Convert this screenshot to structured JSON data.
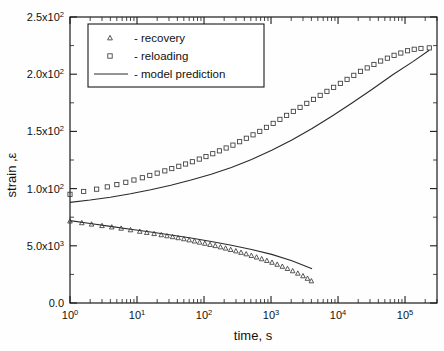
{
  "chart_data": {
    "type": "scatter",
    "title": "",
    "xlabel": "time, s",
    "ylabel": "strain ,ε",
    "xscale": "log",
    "yscale": "linear",
    "xlim": [
      1,
      300000
    ],
    "ylim": [
      0,
      250
    ],
    "grid": false,
    "legend_position": "top-left",
    "xticklabels": [
      "10",
      "10",
      "10",
      "10",
      "10",
      "10"
    ],
    "xtickexponents": [
      "0",
      "1",
      "2",
      "3",
      "4",
      "5"
    ],
    "xtickvalues": [
      1,
      10,
      100,
      1000,
      10000,
      100000
    ],
    "yticklabels": [
      "0.0",
      "5.0x10",
      "1.0x10",
      "1.5x10",
      "2.0x10",
      "2.5x10"
    ],
    "ytickexponents": [
      "",
      "3",
      "2",
      "2",
      "2",
      "2"
    ],
    "ytickvalues": [
      0,
      50,
      100,
      150,
      200,
      250
    ],
    "series": [
      {
        "name": "recovery",
        "marker": "triangle",
        "legend_label": "- recovery",
        "points": [
          [
            1.0,
            71.5
          ],
          [
            1.5,
            70.0
          ],
          [
            2.1,
            68.8
          ],
          [
            3.0,
            67.5
          ],
          [
            4.2,
            66.3
          ],
          [
            5.8,
            65.2
          ],
          [
            8.0,
            63.8
          ],
          [
            11.0,
            62.5
          ],
          [
            14.0,
            61.5
          ],
          [
            18.0,
            60.5
          ],
          [
            23.0,
            59.5
          ],
          [
            28.0,
            58.6
          ],
          [
            34.0,
            57.8
          ],
          [
            41.0,
            56.9
          ],
          [
            50.0,
            56.0
          ],
          [
            60.0,
            55.0
          ],
          [
            72.0,
            54.0
          ],
          [
            86.0,
            53.0
          ],
          [
            103.0,
            52.0
          ],
          [
            123.0,
            51.0
          ],
          [
            147.0,
            50.0
          ],
          [
            176.0,
            48.9
          ],
          [
            210.0,
            47.8
          ],
          [
            250.0,
            46.6
          ],
          [
            299.0,
            45.4
          ],
          [
            357.0,
            44.1
          ],
          [
            426.0,
            42.8
          ],
          [
            509.0,
            41.4
          ],
          [
            608.0,
            40.0
          ],
          [
            726.0,
            38.5
          ],
          [
            867.0,
            37.0
          ],
          [
            1035.0,
            35.4
          ],
          [
            1236.0,
            33.7
          ],
          [
            1476.0,
            31.9
          ],
          [
            1762.0,
            30.0
          ],
          [
            2104.0,
            28.0
          ],
          [
            2512.0,
            25.9
          ],
          [
            3000.0,
            23.6
          ],
          [
            3500.0,
            21.4
          ],
          [
            4000.0,
            19.2
          ]
        ]
      },
      {
        "name": "reloading",
        "marker": "square",
        "legend_label": "- reloading",
        "points": [
          [
            1.0,
            95.0
          ],
          [
            1.6,
            97.5
          ],
          [
            2.5,
            99.5
          ],
          [
            3.6,
            101.5
          ],
          [
            5.0,
            103.5
          ],
          [
            6.8,
            105.5
          ],
          [
            9.0,
            107.5
          ],
          [
            12.0,
            109.5
          ],
          [
            15.5,
            111.5
          ],
          [
            20.0,
            113.5
          ],
          [
            26.0,
            115.5
          ],
          [
            33.0,
            117.5
          ],
          [
            42.0,
            119.5
          ],
          [
            53.0,
            121.5
          ],
          [
            67.0,
            123.5
          ],
          [
            85.0,
            125.8
          ],
          [
            107.0,
            128.0
          ],
          [
            135.0,
            130.5
          ],
          [
            170.0,
            133.0
          ],
          [
            214.0,
            135.5
          ],
          [
            270.0,
            138.0
          ],
          [
            340.0,
            141.0
          ],
          [
            428.0,
            144.0
          ],
          [
            539.0,
            147.0
          ],
          [
            679.0,
            150.0
          ],
          [
            855.0,
            153.5
          ],
          [
            1077.0,
            157.0
          ],
          [
            1357.0,
            160.5
          ],
          [
            1709.0,
            164.0
          ],
          [
            2153.0,
            167.5
          ],
          [
            2712.0,
            171.0
          ],
          [
            3416.0,
            174.5
          ],
          [
            4303.0,
            178.0
          ],
          [
            5420.0,
            181.5
          ],
          [
            6827.0,
            185.0
          ],
          [
            8600.0,
            188.5
          ],
          [
            10832.0,
            192.0
          ],
          [
            13644.0,
            195.5
          ],
          [
            17185.0,
            199.0
          ],
          [
            21646.0,
            202.5
          ],
          [
            27265.0,
            205.5
          ],
          [
            34344.0,
            208.5
          ],
          [
            43260.0,
            211.5
          ],
          [
            54491.0,
            214.0
          ],
          [
            68640.0,
            216.5
          ],
          [
            86463.0,
            218.5
          ],
          [
            108914.0,
            220.5
          ],
          [
            137187.0,
            221.8
          ],
          [
            172800.0,
            222.5
          ],
          [
            230000.0,
            223.0
          ]
        ]
      },
      {
        "name": "model prediction",
        "marker": "line",
        "legend_label": "- model prediction",
        "curves": [
          {
            "id": "model-upper",
            "points": [
              [
                1.0,
                88.0
              ],
              [
                2.0,
                90.0
              ],
              [
                4.0,
                92.5
              ],
              [
                8.0,
                95.5
              ],
              [
                16.0,
                99.0
              ],
              [
                32.0,
                103.0
              ],
              [
                64.0,
                107.5
              ],
              [
                128.0,
                112.5
              ],
              [
                256.0,
                118.5
              ],
              [
                512.0,
                125.5
              ],
              [
                1024.0,
                133.5
              ],
              [
                2048.0,
                142.5
              ],
              [
                4096.0,
                152.5
              ],
              [
                8192.0,
                163.5
              ],
              [
                16384.0,
                175.0
              ],
              [
                32768.0,
                187.0
              ],
              [
                65536.0,
                199.5
              ],
              [
                131072.0,
                211.0
              ],
              [
                230000.0,
                221.0
              ]
            ]
          },
          {
            "id": "model-lower",
            "points": [
              [
                1.0,
                72.0
              ],
              [
                2.0,
                69.5
              ],
              [
                4.0,
                67.0
              ],
              [
                8.0,
                64.5
              ],
              [
                16.0,
                62.0
              ],
              [
                32.0,
                59.5
              ],
              [
                64.0,
                56.8
              ],
              [
                128.0,
                53.8
              ],
              [
                256.0,
                50.5
              ],
              [
                512.0,
                46.8
              ],
              [
                1024.0,
                42.5
              ],
              [
                2048.0,
                37.0
              ],
              [
                4096.0,
                30.0
              ]
            ]
          }
        ]
      }
    ]
  },
  "axes": {
    "x_title": "time, s",
    "y_title": "strain ,ε"
  }
}
